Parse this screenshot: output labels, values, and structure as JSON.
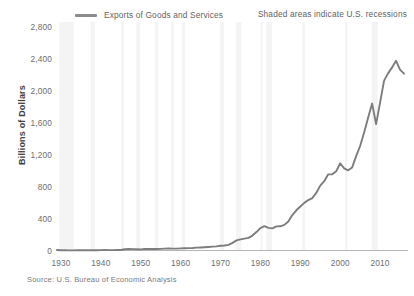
{
  "legend": {
    "label": "Exports of Goods and Services",
    "color": "#8c8c8c"
  },
  "note": {
    "recessions": "Shaded areas indicate U.S. recessions"
  },
  "source": {
    "text": "Source: U.S. Bureau of Economic Analysis"
  },
  "axes": {
    "ylabel": "Billions of Dollars",
    "yticks": [
      "2,800",
      "2,400",
      "2,000",
      "1,600",
      "1,200",
      "800",
      "400",
      "0"
    ],
    "xticks": [
      "1930",
      "1940",
      "1950",
      "1960",
      "1970",
      "1980",
      "1990",
      "2000",
      "2010"
    ]
  },
  "chart_data": {
    "type": "line",
    "title": "",
    "xlabel": "",
    "ylabel": "Billions of Dollars",
    "xlim": [
      1929,
      2017
    ],
    "ylim": [
      0,
      2800
    ],
    "ytick_values": [
      0,
      400,
      800,
      1200,
      1600,
      2000,
      2400,
      2800
    ],
    "xtick_values": [
      1930,
      1940,
      1950,
      1960,
      1970,
      1980,
      1990,
      2000,
      2010
    ],
    "grid": false,
    "legend_position": "top-left",
    "line_color": "#7d7d7d",
    "recession_band_color": "#f4f4f4",
    "series": [
      {
        "name": "Exports of Goods and Services",
        "x": [
          1929,
          1930,
          1931,
          1932,
          1933,
          1934,
          1935,
          1936,
          1937,
          1938,
          1939,
          1940,
          1941,
          1942,
          1943,
          1944,
          1945,
          1946,
          1947,
          1948,
          1949,
          1950,
          1951,
          1952,
          1953,
          1954,
          1955,
          1956,
          1957,
          1958,
          1959,
          1960,
          1961,
          1962,
          1963,
          1964,
          1965,
          1966,
          1967,
          1968,
          1969,
          1970,
          1971,
          1972,
          1973,
          1974,
          1975,
          1976,
          1977,
          1978,
          1979,
          1980,
          1981,
          1982,
          1983,
          1984,
          1985,
          1986,
          1987,
          1988,
          1989,
          1990,
          1991,
          1992,
          1993,
          1994,
          1995,
          1996,
          1997,
          1998,
          1999,
          2000,
          2001,
          2002,
          2003,
          2004,
          2005,
          2006,
          2007,
          2008,
          2009,
          2010,
          2011,
          2012,
          2013,
          2014,
          2015,
          2016
        ],
        "values": [
          6,
          4,
          3,
          2,
          2,
          3,
          3,
          3,
          4,
          4,
          4,
          5,
          6,
          5,
          5,
          6,
          7,
          15,
          20,
          17,
          16,
          14,
          20,
          19,
          18,
          18,
          20,
          24,
          27,
          23,
          24,
          27,
          28,
          30,
          32,
          36,
          38,
          41,
          44,
          48,
          52,
          60,
          63,
          71,
          95,
          127,
          139,
          149,
          159,
          187,
          231,
          281,
          305,
          283,
          277,
          302,
          303,
          321,
          364,
          444,
          504,
          552,
          597,
          632,
          656,
          721,
          813,
          868,
          954,
          954,
          992,
          1093,
          1028,
          1004,
          1041,
          1183,
          1309,
          1477,
          1664,
          1841,
          1583,
          1853,
          2128,
          2219,
          2294,
          2376,
          2266,
          2215
        ]
      }
    ],
    "recessions": [
      {
        "start": 1929.6,
        "end": 1933.2
      },
      {
        "start": 1937.4,
        "end": 1938.5
      },
      {
        "start": 1945.1,
        "end": 1945.8
      },
      {
        "start": 1948.9,
        "end": 1949.8
      },
      {
        "start": 1953.5,
        "end": 1954.4
      },
      {
        "start": 1957.6,
        "end": 1958.3
      },
      {
        "start": 1960.3,
        "end": 1961.1
      },
      {
        "start": 1969.9,
        "end": 1970.9
      },
      {
        "start": 1973.9,
        "end": 1975.2
      },
      {
        "start": 1980.0,
        "end": 1980.5
      },
      {
        "start": 1981.5,
        "end": 1982.9
      },
      {
        "start": 1990.5,
        "end": 1991.2
      },
      {
        "start": 2001.2,
        "end": 2001.8
      },
      {
        "start": 2007.9,
        "end": 2009.4
      }
    ]
  }
}
